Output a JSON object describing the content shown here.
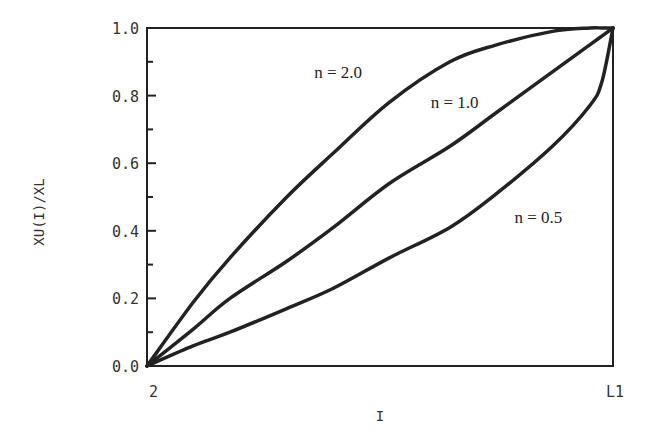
{
  "chart_data": {
    "type": "line",
    "title": "",
    "xlabel": "I",
    "ylabel": "XU(I)/XL",
    "x_tick_labels": [
      "2",
      "L1"
    ],
    "y_tick_labels": [
      "0.0",
      "0.2",
      "0.4",
      "0.6",
      "0.8",
      "1.0"
    ],
    "ylim": [
      0,
      1.0
    ],
    "xlim": [
      0,
      1.0
    ],
    "grid": false,
    "legend": "inline labels",
    "x": [
      0.0,
      0.1,
      0.178,
      0.3,
      0.4,
      0.52,
      0.65,
      0.75,
      0.87,
      0.95,
      0.976,
      1.0
    ],
    "series": [
      {
        "name": "n = 2.0",
        "label": "n = 2.0",
        "values": [
          0.0,
          0.19,
          0.32,
          0.5,
          0.63,
          0.78,
          0.9,
          0.95,
          0.99,
          1.0,
          1.0,
          1.0
        ]
      },
      {
        "name": "n = 1.0",
        "label": "n = 1.0",
        "values": [
          0.0,
          0.11,
          0.2,
          0.31,
          0.41,
          0.54,
          0.65,
          0.75,
          0.87,
          0.95,
          0.976,
          1.0
        ]
      },
      {
        "name": "n = 0.5",
        "label": "n = 0.5",
        "values": [
          0.0,
          0.06,
          0.1,
          0.17,
          0.23,
          0.32,
          0.41,
          0.51,
          0.65,
          0.77,
          0.84,
          1.0
        ]
      }
    ],
    "annotations": [
      {
        "text": "n = 2.0",
        "x": 0.41,
        "y": 0.87
      },
      {
        "text": "n = 1.0",
        "x": 0.66,
        "y": 0.78
      },
      {
        "text": "n = 0.5",
        "x": 0.84,
        "y": 0.44
      }
    ]
  }
}
